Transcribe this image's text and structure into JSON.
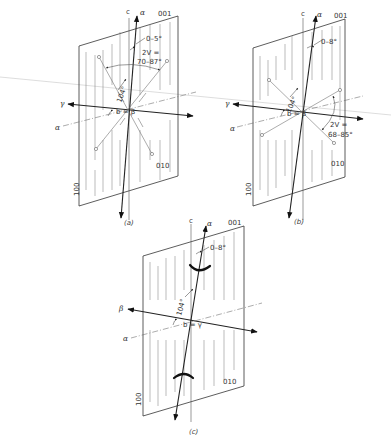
{
  "figure": {
    "panels": [
      {
        "id": "a",
        "caption": "(a)",
        "face_labels": {
          "top": "001",
          "side": "010",
          "left": "100"
        },
        "axis_labels": {
          "c": "c",
          "optic_top": "α",
          "horizontal_left": "γ",
          "horizontal_dash": "α",
          "center": "b = β"
        },
        "angle_extinction": "0–5°",
        "angle_beta": "104°",
        "two_v_label": "2V =",
        "two_v_range": "70–87°"
      },
      {
        "id": "b",
        "caption": "(b)",
        "face_labels": {
          "top": "001",
          "side": "010",
          "left": "100"
        },
        "axis_labels": {
          "c": "c",
          "optic_top": "α",
          "horizontal_left": "γ",
          "horizontal_dash": "α",
          "center": "b = β"
        },
        "angle_extinction": "0–8°",
        "angle_beta": "104°",
        "two_v_label": "2V =",
        "two_v_range": "68–85°"
      },
      {
        "id": "c",
        "caption": "(c)",
        "face_labels": {
          "top": "001",
          "side": "010",
          "left": "100"
        },
        "axis_labels": {
          "c": "c",
          "optic_top": "α",
          "horizontal_left": "β",
          "horizontal_dash": "α",
          "center": "b = γ"
        },
        "angle_extinction": "0–8°",
        "angle_beta": "104°"
      }
    ]
  }
}
